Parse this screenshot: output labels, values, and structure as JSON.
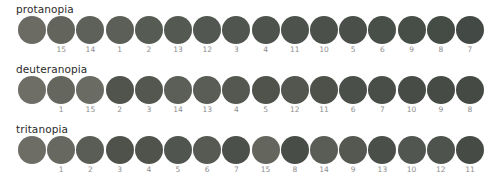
{
  "figure": {
    "title": "",
    "background_color": "#ffffff",
    "label_color": "#8d8d8d",
    "title_color": "#2b2b2b",
    "swatch_count_per_row": 16,
    "first_swatch_unlabeled": true
  },
  "chart_data": {
    "type": "heatmap",
    "title": "",
    "xlabel": "",
    "ylabel": "",
    "legend": "none",
    "grid": false,
    "rows": [
      {
        "name": "protanopia",
        "labels": [
          "",
          "15",
          "14",
          "1",
          "2",
          "13",
          "12",
          "3",
          "4",
          "11",
          "10",
          "5",
          "6",
          "9",
          "8",
          "7"
        ],
        "colors": [
          "#6b6b64",
          "#63655d",
          "#5e6159",
          "#5b5f57",
          "#565b53",
          "#545a52",
          "#525851",
          "#50564f",
          "#4e544d",
          "#4d534c",
          "#4b514a",
          "#4a5049",
          "#484e48",
          "#474d47",
          "#454b45",
          "#434944"
        ]
      },
      {
        "name": "deuteranopia",
        "labels": [
          "",
          "1",
          "15",
          "2",
          "3",
          "14",
          "13",
          "4",
          "5",
          "12",
          "11",
          "6",
          "7",
          "10",
          "9",
          "8"
        ],
        "colors": [
          "#6e6e66",
          "#65665e",
          "#6a6b62",
          "#50544d",
          "#53574f",
          "#5c5f57",
          "#5a5d55",
          "#545850",
          "#4f534c",
          "#52564e",
          "#4d514a",
          "#4b4f49",
          "#4a4e48",
          "#484c47",
          "#464b46",
          "#454a45"
        ]
      },
      {
        "name": "tritanopia",
        "labels": [
          "",
          "1",
          "2",
          "3",
          "4",
          "5",
          "6",
          "7",
          "15",
          "8",
          "14",
          "9",
          "13",
          "10",
          "12",
          "11"
        ],
        "colors": [
          "#6d6d66",
          "#67685f",
          "#595d55",
          "#4e524b",
          "#4f534c",
          "#505550",
          "#565a53",
          "#4c504a",
          "#64665e",
          "#484d47",
          "#5a5d56",
          "#545851",
          "#4b4f49",
          "#525651",
          "#4f534d",
          "#464b46"
        ]
      }
    ]
  }
}
